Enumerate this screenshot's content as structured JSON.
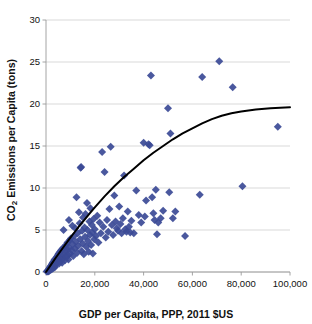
{
  "chart_data": {
    "type": "scatter",
    "title": "",
    "xlabel": "GDP per Capita, PPP, 2011 $US",
    "ylabel": "CO2 Emissions per Capita (tons)",
    "ylabel_parts": {
      "prefix": "CO",
      "subscript": "2",
      "suffix": " Emissions per Capita (tons)"
    },
    "xlim": [
      0,
      100000
    ],
    "ylim": [
      0,
      30
    ],
    "xticks": [
      0,
      20000,
      40000,
      60000,
      80000,
      100000
    ],
    "xtick_labels": [
      "0",
      "20,000",
      "40,000",
      "60,000",
      "80,000",
      "100,000"
    ],
    "yticks": [
      0,
      5,
      10,
      15,
      20,
      25,
      30
    ],
    "ytick_labels": [
      "0",
      "5",
      "10",
      "15",
      "20",
      "25",
      "30"
    ],
    "grid": "horizontal",
    "legend": "none",
    "marker": {
      "shape": "diamond",
      "color": "#3b4a96",
      "size": 4
    },
    "trendline": {
      "name": "logarithmic fit",
      "color": "#000000",
      "width": 2,
      "points": [
        [
          0,
          0.0
        ],
        [
          2000,
          0.85
        ],
        [
          4000,
          1.7
        ],
        [
          6000,
          2.5
        ],
        [
          8000,
          3.3
        ],
        [
          10000,
          4.1
        ],
        [
          12000,
          4.85
        ],
        [
          14000,
          5.6
        ],
        [
          16000,
          6.3
        ],
        [
          18000,
          7.0
        ],
        [
          20000,
          7.7
        ],
        [
          24000,
          9.0
        ],
        [
          28000,
          10.2
        ],
        [
          32000,
          11.3
        ],
        [
          36000,
          12.3
        ],
        [
          40000,
          13.3
        ],
        [
          44000,
          14.2
        ],
        [
          48000,
          15.0
        ],
        [
          52000,
          15.8
        ],
        [
          56000,
          16.5
        ],
        [
          60000,
          17.1
        ],
        [
          64000,
          17.7
        ],
        [
          68000,
          18.2
        ],
        [
          72000,
          18.6
        ],
        [
          76000,
          18.9
        ],
        [
          80000,
          19.1
        ],
        [
          86000,
          19.35
        ],
        [
          92000,
          19.5
        ],
        [
          100000,
          19.6
        ]
      ]
    },
    "points": [
      [
        300,
        0.05
      ],
      [
        500,
        0.1
      ],
      [
        700,
        0.15
      ],
      [
        800,
        0.05
      ],
      [
        900,
        0.2
      ],
      [
        1000,
        0.1
      ],
      [
        1100,
        0.3
      ],
      [
        1200,
        0.2
      ],
      [
        1300,
        0.4
      ],
      [
        1400,
        0.15
      ],
      [
        1500,
        0.5
      ],
      [
        1600,
        0.25
      ],
      [
        1700,
        0.6
      ],
      [
        1800,
        0.35
      ],
      [
        1900,
        0.45
      ],
      [
        2000,
        0.7
      ],
      [
        2100,
        0.3
      ],
      [
        2200,
        0.8
      ],
      [
        2300,
        0.5
      ],
      [
        2400,
        0.9
      ],
      [
        2500,
        0.6
      ],
      [
        2600,
        1.0
      ],
      [
        2700,
        0.4
      ],
      [
        2800,
        1.1
      ],
      [
        2900,
        0.7
      ],
      [
        3000,
        1.2
      ],
      [
        3100,
        0.9
      ],
      [
        3200,
        0.5
      ],
      [
        3300,
        1.3
      ],
      [
        3400,
        0.8
      ],
      [
        3500,
        1.5
      ],
      [
        3600,
        1.0
      ],
      [
        3700,
        0.6
      ],
      [
        3800,
        1.4
      ],
      [
        3900,
        1.1
      ],
      [
        4000,
        1.6
      ],
      [
        4200,
        0.9
      ],
      [
        4400,
        1.8
      ],
      [
        4600,
        1.2
      ],
      [
        4800,
        2.0
      ],
      [
        5000,
        1.4
      ],
      [
        5200,
        2.2
      ],
      [
        5400,
        1.0
      ],
      [
        5600,
        1.7
      ],
      [
        5800,
        2.4
      ],
      [
        6000,
        1.3
      ],
      [
        6200,
        2.6
      ],
      [
        6400,
        1.9
      ],
      [
        6600,
        1.1
      ],
      [
        6800,
        2.8
      ],
      [
        7000,
        1.6
      ],
      [
        7200,
        5.0
      ],
      [
        7400,
        2.1
      ],
      [
        7600,
        3.0
      ],
      [
        7800,
        1.4
      ],
      [
        8000,
        2.4
      ],
      [
        8200,
        3.2
      ],
      [
        8400,
        1.8
      ],
      [
        8600,
        2.7
      ],
      [
        8800,
        3.5
      ],
      [
        9000,
        2.0
      ],
      [
        9200,
        1.5
      ],
      [
        9400,
        6.2
      ],
      [
        9600,
        2.9
      ],
      [
        9800,
        3.8
      ],
      [
        10000,
        2.2
      ],
      [
        10200,
        4.0
      ],
      [
        10500,
        2.6
      ],
      [
        10800,
        5.5
      ],
      [
        11000,
        3.3
      ],
      [
        11200,
        1.9
      ],
      [
        11500,
        4.3
      ],
      [
        11800,
        2.8
      ],
      [
        12000,
        5.2
      ],
      [
        12200,
        3.6
      ],
      [
        12500,
        8.9
      ],
      [
        12800,
        2.3
      ],
      [
        13000,
        4.6
      ],
      [
        13200,
        3.1
      ],
      [
        13500,
        7.1
      ],
      [
        13800,
        5.8
      ],
      [
        14000,
        3.9
      ],
      [
        14200,
        12.4
      ],
      [
        14400,
        12.5
      ],
      [
        14600,
        2.5
      ],
      [
        14800,
        4.9
      ],
      [
        15000,
        3.4
      ],
      [
        15200,
        6.5
      ],
      [
        15500,
        2.1
      ],
      [
        15800,
        5.3
      ],
      [
        16000,
        4.2
      ],
      [
        16200,
        6.9
      ],
      [
        16500,
        3.0
      ],
      [
        16800,
        8.2
      ],
      [
        17000,
        5.0
      ],
      [
        17200,
        3.7
      ],
      [
        17500,
        2.4
      ],
      [
        17800,
        6.0
      ],
      [
        18000,
        4.4
      ],
      [
        18200,
        7.6
      ],
      [
        18500,
        3.2
      ],
      [
        18800,
        5.6
      ],
      [
        19000,
        4.7
      ],
      [
        19200,
        2.2
      ],
      [
        19500,
        6.3
      ],
      [
        19800,
        3.9
      ],
      [
        20000,
        5.1
      ],
      [
        20500,
        4.3
      ],
      [
        21000,
        6.7
      ],
      [
        21500,
        3.5
      ],
      [
        22000,
        5.9
      ],
      [
        22500,
        4.6
      ],
      [
        23000,
        14.3
      ],
      [
        23500,
        5.4
      ],
      [
        24000,
        11.9
      ],
      [
        24500,
        4.1
      ],
      [
        25000,
        6.2
      ],
      [
        25500,
        4.8
      ],
      [
        26000,
        7.5
      ],
      [
        26500,
        14.9
      ],
      [
        27000,
        5.6
      ],
      [
        27500,
        4.4
      ],
      [
        28000,
        9.1
      ],
      [
        28500,
        6.0
      ],
      [
        29000,
        5.2
      ],
      [
        29500,
        4.9
      ],
      [
        30000,
        7.8
      ],
      [
        30500,
        5.7
      ],
      [
        31000,
        4.6
      ],
      [
        31500,
        6.4
      ],
      [
        32000,
        11.5
      ],
      [
        32500,
        5.1
      ],
      [
        33000,
        4.8
      ],
      [
        33500,
        7.2
      ],
      [
        34000,
        5.4
      ],
      [
        34500,
        4.7
      ],
      [
        35000,
        6.1
      ],
      [
        36000,
        4.6
      ],
      [
        37000,
        9.7
      ],
      [
        38000,
        6.8
      ],
      [
        39000,
        5.9
      ],
      [
        40000,
        15.4
      ],
      [
        40500,
        6.6
      ],
      [
        41000,
        8.5
      ],
      [
        42000,
        15.2
      ],
      [
        42500,
        15.1
      ],
      [
        43000,
        23.4
      ],
      [
        43500,
        8.9
      ],
      [
        44000,
        7.0
      ],
      [
        44500,
        6.2
      ],
      [
        45000,
        9.8
      ],
      [
        45500,
        4.5
      ],
      [
        46000,
        5.9
      ],
      [
        47000,
        6.4
      ],
      [
        48000,
        7.3
      ],
      [
        50000,
        19.5
      ],
      [
        50500,
        9.5
      ],
      [
        51000,
        16.5
      ],
      [
        52000,
        6.4
      ],
      [
        53000,
        7.2
      ],
      [
        57000,
        4.3
      ],
      [
        63000,
        9.2
      ],
      [
        64000,
        23.2
      ],
      [
        71000,
        25.1
      ],
      [
        76500,
        22.0
      ],
      [
        80500,
        10.2
      ],
      [
        95000,
        17.3
      ]
    ]
  }
}
